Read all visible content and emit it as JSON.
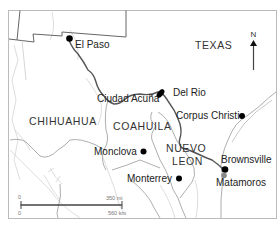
{
  "map": {
    "title": "Texas–Mexico border region",
    "colors": {
      "border_line": "#555555",
      "state_line": "#9a9a9a",
      "river_faint": "#c8c8c8",
      "city_dot": "#000000",
      "frame": "#bbbbbb",
      "background": "#ffffff"
    },
    "regions": [
      {
        "id": "texas",
        "label": "TEXAS"
      },
      {
        "id": "chihuahua",
        "label": "CHIHUAHUA"
      },
      {
        "id": "coahuila",
        "label": "COAHUILA"
      },
      {
        "id": "nuevo-leon",
        "label_line1": "NUEVO",
        "label_line2": "LEON"
      }
    ],
    "cities": [
      {
        "id": "el-paso",
        "name": "El Paso"
      },
      {
        "id": "ciudad-acuna",
        "name": "Ciudad Acuña"
      },
      {
        "id": "del-rio",
        "name": "Del Rio"
      },
      {
        "id": "corpus-christi",
        "name": "Corpus Christi"
      },
      {
        "id": "monclova",
        "name": "Monclova"
      },
      {
        "id": "monterrey",
        "name": "Monterrey"
      },
      {
        "id": "brownsville",
        "name": "Brownsville"
      },
      {
        "id": "matamoros",
        "name": "Matamoros"
      }
    ],
    "north_arrow": {
      "label": "N",
      "icon": "north-arrow-icon"
    },
    "scale_bar": {
      "start_top": "0",
      "start_bottom": "0",
      "end_top": "350 mi",
      "end_bottom": "560 km"
    }
  }
}
